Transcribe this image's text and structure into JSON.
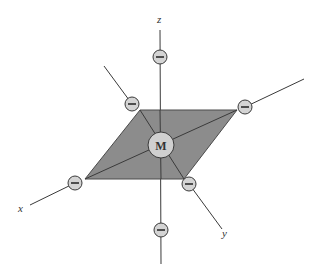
{
  "diagram": {
    "type": "octahedral-coordination",
    "metal": {
      "label": "M",
      "x": 161,
      "y": 145,
      "r": 13
    },
    "axes": {
      "x": {
        "label": "x",
        "label_pos": [
          22,
          209
        ]
      },
      "y": {
        "label": "y",
        "label_pos": [
          224,
          235
        ]
      },
      "z": {
        "label": "z",
        "label_pos": [
          157,
          23
        ]
      }
    },
    "ligands": [
      {
        "name": "ligand-z-top",
        "x": 160,
        "y": 57,
        "symbol": "−"
      },
      {
        "name": "ligand-z-bottom",
        "x": 161,
        "y": 230,
        "symbol": "−"
      },
      {
        "name": "ligand-back-left",
        "x": 132,
        "y": 104,
        "symbol": "−"
      },
      {
        "name": "ligand-back-right",
        "x": 245,
        "y": 107,
        "symbol": "−"
      },
      {
        "name": "ligand-x",
        "x": 75,
        "y": 183,
        "symbol": "−"
      },
      {
        "name": "ligand-y",
        "x": 189,
        "y": 184,
        "symbol": "−"
      }
    ],
    "plane": {
      "vertices": [
        [
          140,
          110
        ],
        [
          237,
          110
        ],
        [
          184,
          179
        ],
        [
          85,
          179
        ]
      ],
      "fill": "#8c8c8c"
    },
    "colors": {
      "line": "#3a3a3a",
      "ligand_fill": "#d4d4d4",
      "metal_fill": "#d0d0d0"
    }
  }
}
